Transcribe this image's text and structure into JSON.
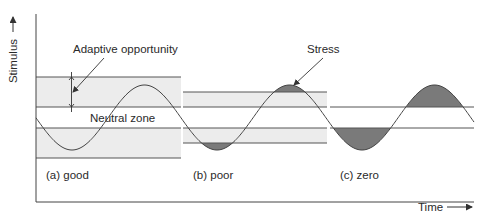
{
  "figure": {
    "y_axis_label": "Stimulus",
    "x_axis_label": "Time",
    "annotations": {
      "adaptive_opportunity": "Adaptive opportunity",
      "stress": "Stress",
      "neutral_zone": "Neutral zone"
    },
    "panels": [
      {
        "id": "a",
        "label": "(a) good",
        "x0": 36,
        "x1": 181,
        "outer": [
          77,
          158
        ],
        "inner": [
          107,
          128
        ]
      },
      {
        "id": "b",
        "label": "(b) poor",
        "x0": 183,
        "x1": 327,
        "outer": [
          92,
          143
        ],
        "inner": [
          107,
          128
        ]
      },
      {
        "id": "c",
        "label": "(c) zero",
        "x0": 330,
        "x1": 474,
        "outer": [
          107,
          128
        ],
        "inner": [
          107,
          128
        ]
      }
    ],
    "colors": {
      "band_fill": "#ececec",
      "stress_fill": "#7a7a7a",
      "line": "#555555",
      "axis": "#444444"
    }
  },
  "chart_data": {
    "type": "line",
    "title": "",
    "xlabel": "Time",
    "ylabel": "Stimulus",
    "series": [
      {
        "name": "Stimulus (sinusoid)",
        "center_y_px": 117.5,
        "amplitude_px": 32.5,
        "period_px": 145,
        "first_trough_x_px": 72
      }
    ],
    "zones": [
      {
        "panel": "(a) good",
        "adaptive_opportunity": "wide band fully containing the stimulus swing",
        "stress": "none"
      },
      {
        "panel": "(b) poor",
        "adaptive_opportunity": "narrower band",
        "stress": "peak and trough exceed band"
      },
      {
        "panel": "(c) zero",
        "adaptive_opportunity": "none (band equals neutral zone)",
        "stress": "all excursions outside neutral zone"
      }
    ],
    "grid": false,
    "legend": "none"
  }
}
